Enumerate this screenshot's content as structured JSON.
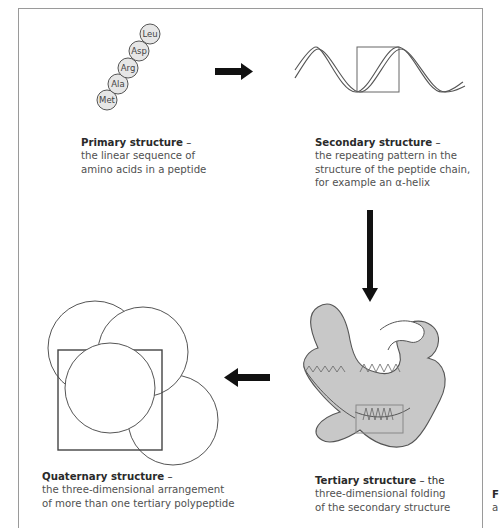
{
  "figure": {
    "amino_acids": [
      "Met",
      "Ala",
      "Arg",
      "Asp",
      "Leu"
    ],
    "primary": {
      "title": "Primary structure",
      "dash": " –",
      "lines": [
        "the linear sequence of",
        "amino acids in a peptide"
      ]
    },
    "secondary": {
      "title": "Secondary structure",
      "dash": " –",
      "lines": [
        "the repeating pattern in the",
        "structure of the peptide chain,",
        "for example an α-helix"
      ]
    },
    "tertiary": {
      "title": "Tertiary structure",
      "dash": " – the",
      "lines": [
        "three-dimensional folding",
        "of the secondary structure"
      ]
    },
    "quaternary": {
      "title": "Quaternary structure",
      "dash": " –",
      "lines": [
        "the three-dimensional arrangement",
        "of more than one tertiary polypeptide"
      ]
    },
    "right_edge_fragment": {
      "title": "F",
      "line": "a"
    },
    "arrows": [
      "arrow-right",
      "arrow-down",
      "arrow-left"
    ],
    "colors": {
      "frame": "#9a9a9a",
      "protein_fill": "#c8c8c8",
      "protein_stroke": "#555555",
      "residue_fill": "#e6e6e6",
      "arrow": "#111111",
      "text": "#505050"
    }
  }
}
